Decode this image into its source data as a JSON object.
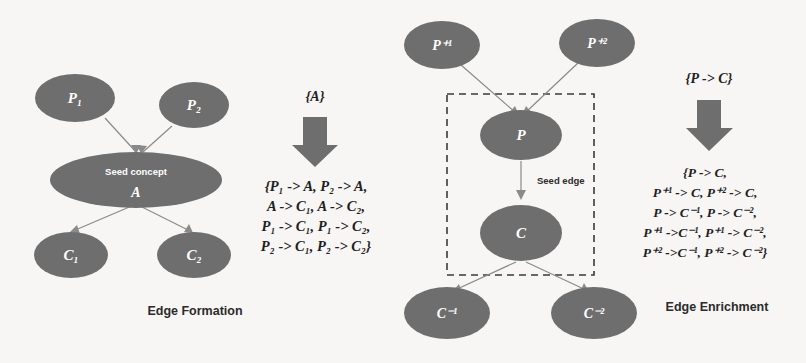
{
  "figure": {
    "background_color": "#f7f6f4",
    "node_fill": "#6e6e6e",
    "edge_color": "#8a8a8a",
    "text_color": "#1f1f1f"
  },
  "left_panel": {
    "caption": "Edge Formation",
    "nodes": {
      "p1": "P₁",
      "p2": "P₂",
      "seed_sub": "Seed concept",
      "seed": "A",
      "c1": "C₁",
      "c2": "C₂"
    },
    "input_set": "{A}",
    "arrow_icon": "down-arrow-icon",
    "output_lines": [
      "{P₁ -> A, P₂ -> A,",
      "A -> C₁, A -> C₂,",
      "P₁ -> C₁, P₁ -> C₂,",
      "P₂ -> C₁, P₂ -> C₂}"
    ]
  },
  "right_panel": {
    "caption": "Edge Enrichment",
    "nodes": {
      "pplus1": "P⁺¹",
      "pplus2": "P⁺²",
      "p": "P",
      "c": "C",
      "cminus1": "C⁻¹",
      "cminus2": "C⁻²"
    },
    "seed_edge_label": "Seed edge",
    "input_set": "{P -> C}",
    "arrow_icon": "down-arrow-icon",
    "output_lines": [
      "{P -> C,",
      "P⁺¹ -> C, P⁺² -> C,",
      "P -> C⁻¹, P -> C⁻²,",
      "P⁺¹ ->C⁻¹, P⁺¹ -> C⁻²,",
      "P⁺² ->C⁻¹, P⁺² -> C⁻²}"
    ]
  }
}
